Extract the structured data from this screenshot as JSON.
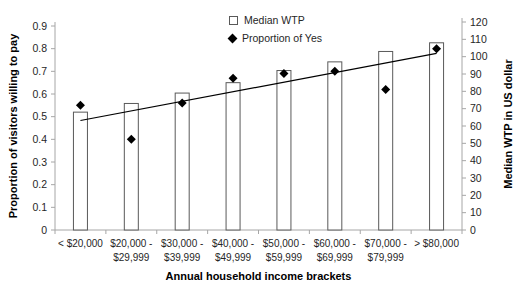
{
  "chart_data": {
    "type": "bar",
    "title": "",
    "xlabel": "Annual household income brackets",
    "left_axis": {
      "label": "Proportion of visitors willing to pay",
      "min": 0,
      "max": 0.9,
      "tick_step": 0.1,
      "ticks": [
        "0",
        "0.1",
        "0.2",
        "0.3",
        "0.4",
        "0.5",
        "0.6",
        "0.7",
        "0.8",
        "0.9"
      ]
    },
    "right_axis": {
      "label": "Median WTP in US dollar",
      "min": 0,
      "max": 120,
      "tick_step": 10,
      "ticks": [
        "0",
        "10",
        "20",
        "30",
        "40",
        "50",
        "60",
        "70",
        "80",
        "90",
        "100",
        "110",
        "120"
      ]
    },
    "categories": [
      "< $20,000",
      "$20,000 - $29,999",
      "$30,000 - $39,999",
      "$40,000 - $49,999",
      "$50,000 - $59,999",
      "$60,000 - $69,999",
      "$70,000 - $79,999",
      "> $80,000"
    ],
    "category_labels": [
      [
        "< $20,000"
      ],
      [
        "$20,000 -",
        "$29,999"
      ],
      [
        "$30,000 -",
        "$39,999"
      ],
      [
        "$40,000 -",
        "$49,999"
      ],
      [
        "$50,000 -",
        "$59,999"
      ],
      [
        "$60,000 -",
        "$69,999"
      ],
      [
        "$70,000 -",
        "$79,999"
      ],
      [
        "> $80,000"
      ]
    ],
    "series": [
      {
        "name": "Median WTP",
        "plot": "bar",
        "axis": "right",
        "values": [
          68,
          73,
          79,
          85,
          92,
          97,
          103,
          108
        ],
        "marker": "open-square"
      },
      {
        "name": "Proportion of Yes",
        "plot": "scatter",
        "axis": "left",
        "values": [
          0.55,
          0.4,
          0.56,
          0.67,
          0.69,
          0.7,
          0.62,
          0.8
        ],
        "marker": "filled-diamond"
      }
    ],
    "trendline": {
      "axis": "left",
      "start_value": 0.483,
      "end_value": 0.779
    },
    "legend": [
      {
        "label": "Median WTP",
        "marker": "open-square"
      },
      {
        "label": "Proportion of Yes",
        "marker": "filled-diamond"
      }
    ],
    "legend_position": "top-center",
    "grid": false,
    "colors": {
      "bar_fill": "#ffffff",
      "bar_stroke": "#595959",
      "marker": "#000000",
      "trendline": "#000000",
      "axis_line": "#a6a6a6",
      "tick_text": "#262626",
      "title_text": "#000000"
    }
  }
}
